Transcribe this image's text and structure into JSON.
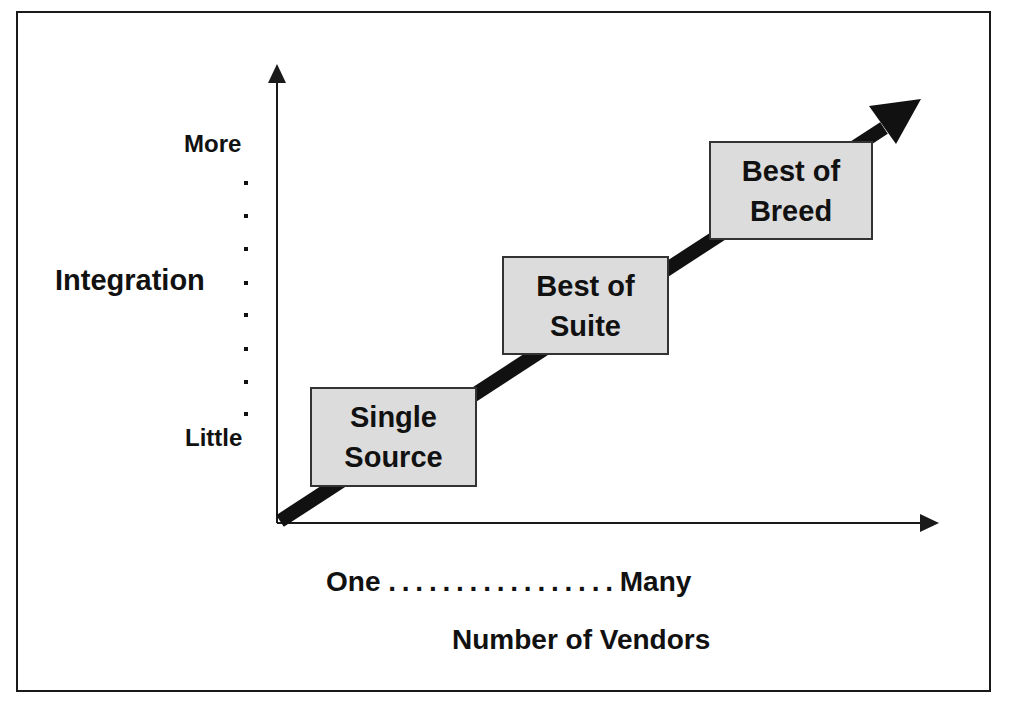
{
  "diagram": {
    "y_axis": {
      "title": "Integration",
      "top_label": "More",
      "bottom_label": "Little",
      "dot_count": 8
    },
    "x_axis": {
      "title": "Number of Vendors",
      "left_label": "One",
      "right_label": "Many",
      "dot_leader": ". . . . . . . . . . . . . . . . ."
    },
    "stages": [
      {
        "line1": "Single",
        "line2": "Source"
      },
      {
        "line1": "Best of",
        "line2": "Suite"
      },
      {
        "line1": "Best of",
        "line2": "Breed"
      }
    ],
    "colors": {
      "box_fill": "#dcdcdc",
      "line": "#111111",
      "background": "#ffffff"
    }
  }
}
